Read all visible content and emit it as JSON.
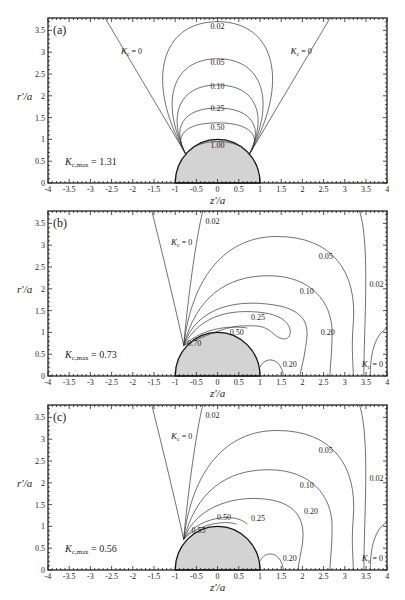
{
  "chart_data": [
    {
      "type": "contour",
      "panel": "(a)",
      "xlabel": "z'/a",
      "ylabel": "r'/a",
      "xlim": [
        -4,
        4
      ],
      "ylim": [
        0,
        3.8
      ],
      "xticks": [
        "-4",
        "-3.5",
        "-3",
        "-2.5",
        "-2",
        "-1.5",
        "-1",
        "-0.5",
        "0",
        "0.5",
        "1",
        "1.5",
        "2",
        "2.5",
        "3",
        "3.5",
        "4"
      ],
      "yticks": [
        "0",
        "0.5",
        "1",
        "1.5",
        "2",
        "2.5",
        "3",
        "3.5"
      ],
      "annotation": "K_c,max = 1.31",
      "contour_levels": [
        "0.02",
        "0.05",
        "0.10",
        "0.25",
        "0.50",
        "1.00"
      ],
      "zero_labels": [
        "K_c = 0",
        "K_c = 0"
      ],
      "sphere_radius": 1
    },
    {
      "type": "contour",
      "panel": "(b)",
      "xlabel": "z'/a",
      "ylabel": "r'/a",
      "xlim": [
        -4,
        4
      ],
      "ylim": [
        0,
        3.8
      ],
      "xticks": [
        "-4",
        "-3.5",
        "-3",
        "-2.5",
        "-2",
        "-1.5",
        "-1",
        "-0.5",
        "0",
        "0.5",
        "1",
        "1.5",
        "2",
        "2.5",
        "3",
        "3.5",
        "4"
      ],
      "yticks": [
        "0",
        "0.5",
        "1",
        "1.5",
        "2",
        "2.5",
        "3",
        "3.5"
      ],
      "annotation": "K_c,max = 0.73",
      "contour_levels": [
        "0.02",
        "0.05",
        "0.10",
        "0.25",
        "0.50",
        "0.70",
        "0.20",
        "0.20",
        "0.02"
      ],
      "zero_labels": [
        "K_c = 0",
        "K_c = 0"
      ],
      "sphere_radius": 1
    },
    {
      "type": "contour",
      "panel": "(c)",
      "xlabel": "z'/a",
      "ylabel": "r'/a",
      "xlim": [
        -4,
        4
      ],
      "ylim": [
        0,
        3.8
      ],
      "xticks": [
        "-4",
        "-3.5",
        "-3",
        "-2.5",
        "-2",
        "-1.5",
        "-1",
        "-0.5",
        "0",
        "0.5",
        "1",
        "1.5",
        "2",
        "2.5",
        "3",
        "3.5",
        "4"
      ],
      "yticks": [
        "0",
        "0.5",
        "1",
        "1.5",
        "2",
        "2.5",
        "3",
        "3.5"
      ],
      "annotation": "K_c,max = 0.56",
      "contour_levels": [
        "0.02",
        "0.05",
        "0.10",
        "0.25",
        "0.50",
        "0.55",
        "0.20",
        "0.20",
        "0.02"
      ],
      "zero_labels": [
        "K_c = 0",
        "K_c = 0"
      ],
      "sphere_radius": 1
    }
  ],
  "panels": {
    "a": {
      "label": "(a)",
      "kmax": "= 1.31",
      "levels": {
        "l002": "0.02",
        "l005": "0.05",
        "l010": "0.10",
        "l025": "0.25",
        "l050": "0.50",
        "l100": "1.00"
      }
    },
    "b": {
      "label": "(b)",
      "kmax": "= 0.73",
      "levels": {
        "l002": "0.02",
        "l005": "0.05",
        "l010": "0.10",
        "l025": "0.25",
        "l050": "0.50",
        "l070": "0.70",
        "l020a": "0.20",
        "l020b": "0.20",
        "l002r": "0.02"
      }
    },
    "c": {
      "label": "(c)",
      "kmax": "= 0.56",
      "levels": {
        "l002": "0.02",
        "l005": "0.05",
        "l010": "0.10",
        "l025": "0.25",
        "l050": "0.50",
        "l055": "0.55",
        "l020a": "0.20",
        "l020b": "0.20",
        "l002r": "0.02"
      }
    }
  },
  "axes": {
    "xlabel": "z'/a",
    "ylabel": "r'/a",
    "xticks": [
      "-4",
      "-3.5",
      "-3",
      "-2.5",
      "-2",
      "-1.5",
      "-1",
      "-0.5",
      "0",
      "0.5",
      "1",
      "1.5",
      "2",
      "2.5",
      "3",
      "3.5",
      "4"
    ],
    "yticks": [
      "0",
      "0.5",
      "1",
      "1.5",
      "2",
      "2.5",
      "3",
      "3.5"
    ],
    "k_symbol": "K",
    "k_sub": "c",
    "k_sub_max": "c,max",
    "k_zero": "= 0"
  }
}
